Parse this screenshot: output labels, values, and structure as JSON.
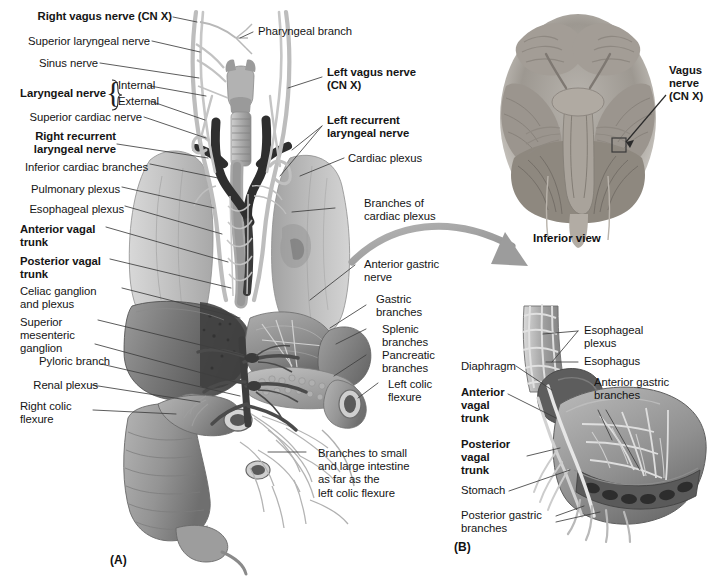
{
  "figure": {
    "panel_a_id": "(A)",
    "panel_b_id": "(B)",
    "inset_caption": "Inferior view"
  },
  "panel_a": {
    "labels_left": [
      {
        "text": "Right vagus nerve (CN X)",
        "bold": true
      },
      {
        "text": "Superior laryngeal nerve",
        "bold": false
      },
      {
        "text": "Sinus nerve",
        "bold": false
      },
      {
        "text": "Laryngeal nerve",
        "bold": true
      },
      {
        "text": "Internal",
        "bold": false
      },
      {
        "text": "External",
        "bold": false
      },
      {
        "text": "Superior cardiac nerve",
        "bold": false
      },
      {
        "text": "Right recurrent\nlaryngeal nerve",
        "bold": true
      },
      {
        "text": "Inferior cardiac branches",
        "bold": false
      },
      {
        "text": "Pulmonary plexus",
        "bold": false
      },
      {
        "text": "Esophageal plexus",
        "bold": false
      },
      {
        "text": "Anterior vagal\ntrunk",
        "bold": true
      },
      {
        "text": "Posterior vagal\ntrunk",
        "bold": true
      },
      {
        "text": "Celiac ganglion\nand plexus",
        "bold": false
      },
      {
        "text": "Superior\nmesenteric\nganglion",
        "bold": false
      },
      {
        "text": "Pyloric branch",
        "bold": false
      },
      {
        "text": "Renal plexus",
        "bold": false
      },
      {
        "text": "Right colic\nflexure",
        "bold": false
      }
    ],
    "labels_right": [
      {
        "text": "Pharyngeal branch",
        "bold": false
      },
      {
        "text": "Left vagus nerve\n(CN X)",
        "bold": true
      },
      {
        "text": "Left recurrent\nlaryngeal nerve",
        "bold": true
      },
      {
        "text": "Cardiac plexus",
        "bold": false
      },
      {
        "text": "Branches of\ncardiac plexus",
        "bold": false
      },
      {
        "text": "Anterior gastric\nnerve",
        "bold": false
      },
      {
        "text": "Gastric\nbranches",
        "bold": false
      },
      {
        "text": "Splenic\nbranches",
        "bold": false
      },
      {
        "text": "Pancreatic\nbranches",
        "bold": false
      },
      {
        "text": "Left colic\nflexure",
        "bold": false
      },
      {
        "text": "Branches to small\nand large intestine\nas far as the\nleft colic flexure",
        "bold": false
      }
    ]
  },
  "panel_b": {
    "labels": [
      {
        "text": "Esophageal\nplexus",
        "bold": false
      },
      {
        "text": "Esophagus",
        "bold": false
      },
      {
        "text": "Diaphragm",
        "bold": false
      },
      {
        "text": "Anterior gastric\nbranches",
        "bold": false
      },
      {
        "text": "Anterior\nvagal\ntrunk",
        "bold": true
      },
      {
        "text": "Posterior\nvagal\ntrunk",
        "bold": true
      },
      {
        "text": "Stomach",
        "bold": false
      },
      {
        "text": "Posterior gastric\nbranches",
        "bold": false
      }
    ]
  },
  "inset": {
    "label": "Vagus\nnerve\n(CN X)",
    "caption": "Inferior view"
  },
  "colors": {
    "background": "#ffffff",
    "text": "#151515",
    "leader_line": "#4a4a4a",
    "arrow": "#9a9a9a",
    "nerve_dark": "#2e2e2e",
    "nerve_light": "#b9b9b9",
    "lung": "#c9c9c9",
    "liver": "#6e6e6e",
    "stomach": "#8d8d8d",
    "intestine": "#9c9c9c"
  }
}
